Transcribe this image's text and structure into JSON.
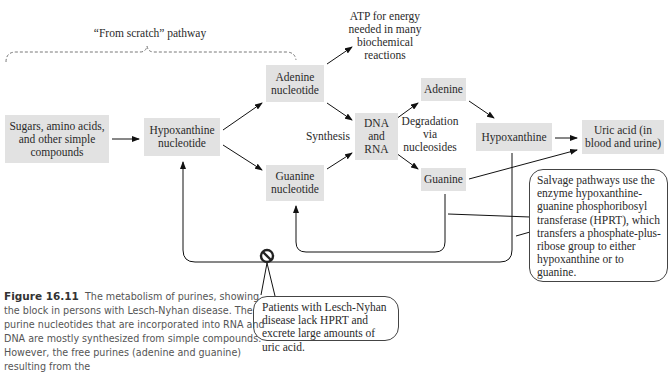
{
  "figure": {
    "bracket_label": "“From scratch” pathway",
    "nodes": {
      "simple_compounds": "Sugars, amino acids, and other simple compounds",
      "hypoxanthine_nucleotide": "Hypoxanthine nucleotide",
      "adenine_nucleotide": "Adenine nucleotide",
      "guanine_nucleotide": "Guanine nucleotide",
      "dna_rna": "DNA and RNA",
      "adenine": "Adenine",
      "guanine": "Guanine",
      "hypoxanthine": "Hypoxanthine",
      "uric_acid": "Uric acid (in blood and urine)"
    },
    "labels": {
      "atp": "ATP for energy needed in many biochemical reactions",
      "synthesis": "Synthesis",
      "degradation": "Degradation via nucleosides"
    },
    "callouts": {
      "salvage": "Salvage pathways use the enzyme hypoxanthine-guanine phosphoribosyl transferase (HPRT), which transfers a phosphate-plus-ribose group to either hypoxanthine or to guanine.",
      "lesch_nyhan": "Patients with Lesch-Nyhan disease lack HPRT and excrete large amounts of uric acid."
    },
    "block_symbol": "no-entry",
    "caption": {
      "number": "Figure 16.11",
      "text": "The metabolism of purines, showing the block in persons with Lesch-Nyhan disease. The purine nucleotides that are incorporated into RNA and DNA are mostly synthesized from simple compounds. However, the free purines (adenine and guanine) resulting from the"
    }
  }
}
